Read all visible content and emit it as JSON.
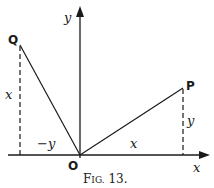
{
  "figure": {
    "caption": "Fig. 13.",
    "caption_main": "F",
    "caption_small": "IG.",
    "caption_num": " 13."
  },
  "axes": {
    "x_label": "x",
    "y_label": "y",
    "origin_label": "O"
  },
  "points": {
    "P": {
      "label": "P"
    },
    "Q": {
      "label": "Q"
    }
  },
  "segments": {
    "OP_horizontal_label": "x",
    "P_vertical_label": "y",
    "Q_vertical_label": "x",
    "OQ_horizontal_label": "−y"
  },
  "colors": {
    "ink": "#1a1a1a",
    "background": "#ffffff"
  }
}
